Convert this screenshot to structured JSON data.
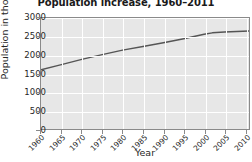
{
  "chart_data": {
    "type": "line",
    "title": "Population increase, 1960–2011",
    "xlabel": "Year",
    "ylabel": "Population in thousands",
    "xlim": [
      1960,
      2011
    ],
    "ylim": [
      0,
      3000
    ],
    "grid": true,
    "legend": "none",
    "xticks": [
      "1960",
      "1965",
      "1970",
      "1975",
      "1980",
      "1985",
      "1990",
      "1995",
      "2000",
      "2005",
      "2010"
    ],
    "xtick_values": [
      1960,
      1965,
      1970,
      1975,
      1980,
      1985,
      1990,
      1995,
      2000,
      2005,
      2010
    ],
    "yticks": [
      "0",
      "500",
      "1000",
      "1500",
      "2000",
      "2500",
      "3000"
    ],
    "ytick_values": [
      0,
      500,
      1000,
      1500,
      2000,
      2500,
      3000
    ],
    "series": [
      {
        "name": "Population",
        "color": "#555555",
        "x": [
          1960,
          1965,
          1970,
          1975,
          1980,
          1985,
          1990,
          1995,
          2000,
          2002,
          2005,
          2011
        ],
        "values": [
          1600,
          1740,
          1880,
          2010,
          2130,
          2230,
          2330,
          2440,
          2560,
          2600,
          2620,
          2650
        ]
      }
    ]
  }
}
